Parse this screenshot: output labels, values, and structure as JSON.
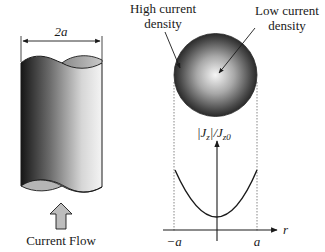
{
  "diagram": {
    "conductor": {
      "width_label": "2a",
      "flow_label": "Current Flow"
    },
    "cross_section": {
      "high_label_line1": "High current",
      "high_label_line2": "density",
      "low_label_line1": "Low current",
      "low_label_line2": "density"
    },
    "plot": {
      "y_axis_label": "|J",
      "y_axis_sub_z": "z",
      "y_axis_mid": "|/J",
      "y_axis_sub_z0": "z0",
      "x_axis_label": "r",
      "left_tick": "−a",
      "right_tick": "a"
    },
    "colors": {
      "ink": "#1a1a1a",
      "cylinder_dark": "#1c1c1c",
      "cylinder_light": "#f2f2f2",
      "arrow_fill": "#bdbdbd"
    }
  }
}
